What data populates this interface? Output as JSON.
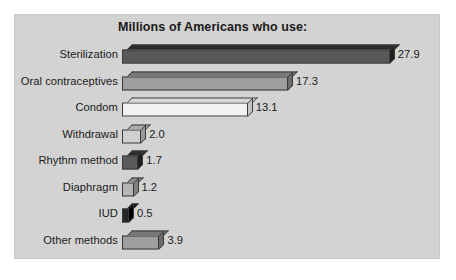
{
  "chart_data": {
    "type": "bar",
    "orientation": "horizontal",
    "title": "Millions of Americans who use:",
    "xlabel": "",
    "ylabel": "",
    "xlim": [
      0,
      30
    ],
    "grid": false,
    "legend": "none",
    "value_label_format": "one-decimal",
    "categories": [
      "Sterilization",
      "Oral contraceptives",
      "Condom",
      "Withdrawal",
      "Rhythm method",
      "Diaphragm",
      "IUD",
      "Other methods"
    ],
    "values": [
      27.9,
      17.3,
      13.1,
      2.0,
      1.7,
      1.2,
      0.5,
      3.9
    ],
    "value_labels": [
      "27.9",
      "17.3",
      "13.1",
      "2.0",
      "1.7",
      "1.2",
      "0.5",
      "3.9"
    ],
    "bar_colors": [
      "#595959",
      "#9e9e9e",
      "#f2f2f2",
      "#cfcfcf",
      "#595959",
      "#b5b5b5",
      "#262626",
      "#9e9e9e"
    ],
    "bar_top_colors": [
      "#2b2b2b",
      "#787878",
      "#d8d8d8",
      "#ababab",
      "#2b2b2b",
      "#8f8f8f",
      "#0d0d0d",
      "#787878"
    ],
    "bar_side_colors": [
      "#1f1f1f",
      "#6b6b6b",
      "#c4c4c4",
      "#999999",
      "#1f1f1f",
      "#818181",
      "#000000",
      "#6b6b6b"
    ]
  },
  "style": {
    "panel_background": "#d3d3d3",
    "page_background": "#ffffff",
    "text_color": "#1a1a1a",
    "outline_color": "#3a3a3a"
  }
}
